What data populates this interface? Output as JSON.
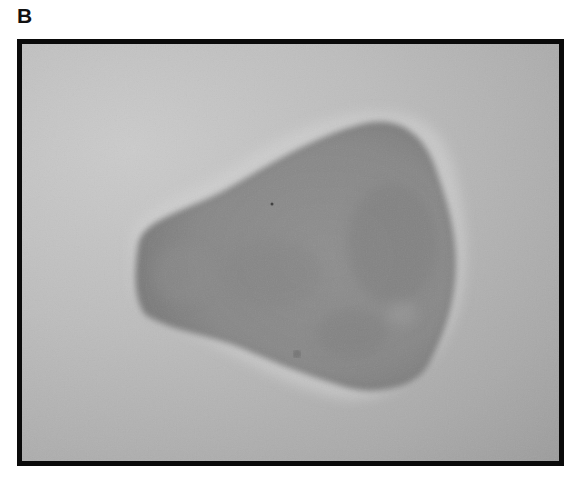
{
  "figure": {
    "panel_label": "B",
    "image": {
      "description": "Grayscale phase-contrast micrograph of a single cell with a fan/pear-shaped body",
      "subject": "cell",
      "colors": {
        "frame_border": "#0a0a0a",
        "background_light": "#cbcbcb",
        "background_dark": "#9c9c9c",
        "cell_body": "#8c8c8c",
        "cell_edge": "#6e6e6e",
        "halo": "#d6d6d6"
      }
    }
  }
}
